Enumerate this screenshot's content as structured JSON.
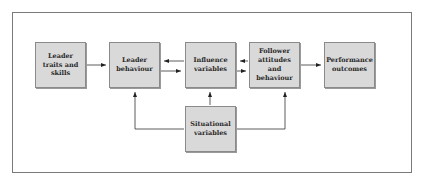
{
  "diagram": {
    "nodes": [
      {
        "id": "leader-traits",
        "label": "Leader traits and skills"
      },
      {
        "id": "leader-behaviour",
        "label": "Leader behaviour"
      },
      {
        "id": "influence-variables",
        "label": "Influence variables"
      },
      {
        "id": "follower-attitudes",
        "label": "Follower attitudes and behaviour"
      },
      {
        "id": "performance-outcomes",
        "label": "Performance outcomes"
      },
      {
        "id": "situational-variables",
        "label": "Situational variables"
      }
    ],
    "edges": [
      {
        "from": "leader-traits",
        "to": "leader-behaviour"
      },
      {
        "from": "leader-behaviour",
        "to": "influence-variables"
      },
      {
        "from": "influence-variables",
        "to": "leader-behaviour"
      },
      {
        "from": "influence-variables",
        "to": "follower-attitudes"
      },
      {
        "from": "follower-attitudes",
        "to": "influence-variables"
      },
      {
        "from": "follower-attitudes",
        "to": "performance-outcomes"
      },
      {
        "from": "situational-variables",
        "to": "leader-behaviour"
      },
      {
        "from": "situational-variables",
        "to": "influence-variables"
      },
      {
        "from": "situational-variables",
        "to": "follower-attitudes"
      }
    ],
    "colors": {
      "box_fill": "#d9d9d9",
      "line": "#333333",
      "frame": "#7a7a7a"
    }
  }
}
